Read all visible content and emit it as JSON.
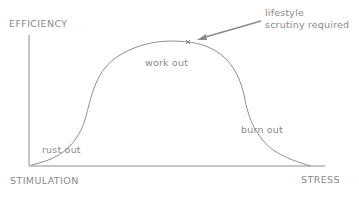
{
  "diagram": {
    "type": "curve",
    "axes": {
      "y_label": "EFFICIENCY",
      "x_label_left": "STIMULATION",
      "x_label_right": "STRESS"
    },
    "annotations": {
      "rust_out": "rust out",
      "work_out": "work out",
      "burn_out": "burn out",
      "callout_line1": "lifestyle",
      "callout_line2": "scrutiny required"
    },
    "colors": {
      "line": "#8f8f8f",
      "text": "#8a8a8a",
      "background": "#ffffff"
    }
  }
}
